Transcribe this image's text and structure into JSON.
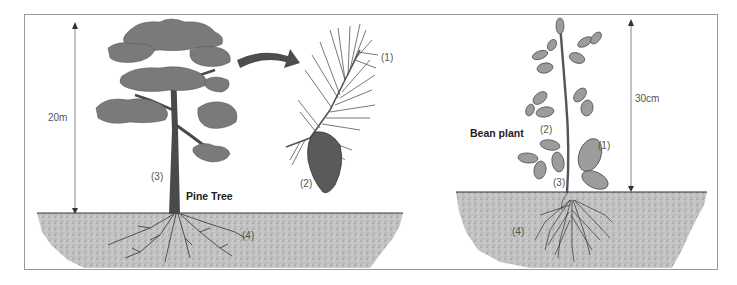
{
  "diagram": {
    "colors": {
      "frame": "#9a9a9a",
      "soil": "#b8b8b8",
      "foliage": "#7a7a7a",
      "trunk": "#4a4a4a",
      "arrow": "#4d4d4d",
      "leaf": "#9c9c9c"
    },
    "pine": {
      "title": "Pine Tree",
      "height_label": "20m",
      "parts": {
        "p1": "(1)",
        "p2": "(2)",
        "p3": "(3)",
        "p4": "(4)"
      }
    },
    "bean": {
      "title": "Bean plant",
      "height_label": "30cm",
      "parts": {
        "p1": "(1)",
        "p2": "(2)",
        "p3": "(3)",
        "p4": "(4)"
      }
    }
  }
}
